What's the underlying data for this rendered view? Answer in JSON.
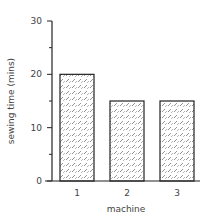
{
  "chart_data": {
    "type": "bar",
    "title": "",
    "xlabel": "machine",
    "ylabel": "sewing time (mins)",
    "categories": [
      "1",
      "2",
      "3"
    ],
    "values": [
      20,
      15,
      15
    ],
    "ylim": [
      0,
      30
    ],
    "yticks": [
      0,
      10,
      20,
      30
    ],
    "yminor_ticks": [
      5,
      15,
      25
    ],
    "grid": false,
    "legend": null,
    "bar_fill": "crosshatch pattern",
    "bar_edge_color": "#222222"
  }
}
